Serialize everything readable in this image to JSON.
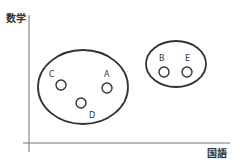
{
  "axes": {
    "y_label": "数学",
    "x_label": "国語",
    "color": "#555555"
  },
  "groups": [
    {
      "name": "group-left",
      "cx": 83,
      "cy": 87,
      "rx": 45,
      "ry": 37,
      "members": [
        {
          "label": "C",
          "cx": 61,
          "cy": 85,
          "lx": 49,
          "ly": 77
        },
        {
          "label": "A",
          "cx": 107,
          "cy": 88,
          "lx": 104,
          "ly": 77
        },
        {
          "label": "D",
          "cx": 81,
          "cy": 103,
          "lx": 89,
          "ly": 118
        }
      ]
    },
    {
      "name": "group-right",
      "cx": 176,
      "cy": 64,
      "rx": 30,
      "ry": 23,
      "members": [
        {
          "label": "B",
          "cx": 164,
          "cy": 72,
          "lx": 159,
          "ly": 61
        },
        {
          "label": "E",
          "cx": 187,
          "cy": 72,
          "lx": 185,
          "ly": 61
        }
      ]
    }
  ],
  "style": {
    "stroke": "#333333",
    "text": "#333333"
  }
}
